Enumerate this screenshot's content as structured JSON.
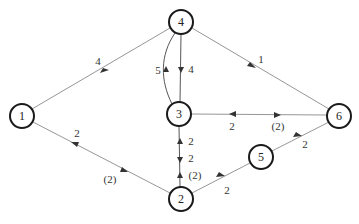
{
  "diagram": {
    "type": "directed-network",
    "nodes": [
      {
        "id": "1",
        "label": "1",
        "x": 22,
        "y": 116
      },
      {
        "id": "2",
        "label": "2",
        "x": 181,
        "y": 199
      },
      {
        "id": "3",
        "label": "3",
        "x": 179,
        "y": 114
      },
      {
        "id": "4",
        "label": "4",
        "x": 181,
        "y": 22
      },
      {
        "id": "5",
        "label": "5",
        "x": 261,
        "y": 157
      },
      {
        "id": "6",
        "label": "6",
        "x": 339,
        "y": 116
      }
    ],
    "edges": [
      {
        "from": "1",
        "to": "4",
        "label": "4"
      },
      {
        "from": "4",
        "to": "6",
        "label": "1"
      },
      {
        "from": "4",
        "to": "3",
        "label": "4"
      },
      {
        "from": "3",
        "to": "4",
        "label": "5",
        "curved": true
      },
      {
        "from": "6",
        "to": "3",
        "label": "2"
      },
      {
        "from": "3",
        "to": "6",
        "label": "(2)"
      },
      {
        "from": "2",
        "to": "1",
        "label": "2"
      },
      {
        "from": "1",
        "to": "2",
        "label": "(2)"
      },
      {
        "from": "2",
        "to": "3",
        "label": "2"
      },
      {
        "from": "3",
        "to": "2",
        "label": "2"
      },
      {
        "from": "2",
        "to": "3",
        "label": "(2)"
      },
      {
        "from": "2",
        "to": "5",
        "label": "2"
      },
      {
        "from": "5",
        "to": "6",
        "label": "2"
      }
    ]
  },
  "labels": {
    "n1": "1",
    "n2": "2",
    "n3": "3",
    "n4": "4",
    "n5": "5",
    "n6": "6",
    "e14": "4",
    "e46": "1",
    "e43": "4",
    "e34": "5",
    "e63": "2",
    "e36": "(2)",
    "e21": "2",
    "e12": "(2)",
    "e23a": "2",
    "e32": "2",
    "e23b": "(2)",
    "e25": "2",
    "e56": "2"
  }
}
